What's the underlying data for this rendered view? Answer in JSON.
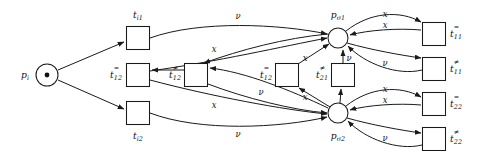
{
  "figure": {
    "kind": "petri-net-diagram",
    "background_color": "#ffffff",
    "stroke_color": "#1a1a1a"
  },
  "places": [
    {
      "id": "p_i",
      "label": "p",
      "sub": "i",
      "tokens": 1,
      "label_position": "left",
      "x": 47,
      "y": 75,
      "r": 11
    },
    {
      "id": "p_sigma1",
      "label": "p",
      "sub": "σ1",
      "tokens": 0,
      "label_position": "above",
      "x": 338,
      "y": 38,
      "r": 10
    },
    {
      "id": "p_sigma2",
      "label": "p",
      "sub": "σ2",
      "tokens": 0,
      "label_position": "below",
      "x": 338,
      "y": 113,
      "r": 10
    }
  ],
  "transitions": [
    {
      "id": "t_i1",
      "label": "t",
      "sub": "i1",
      "sup": "",
      "label_position": "above",
      "x": 138,
      "y": 38,
      "w": 23,
      "h": 23
    },
    {
      "id": "t_i2",
      "label": "t",
      "sub": "i2",
      "sup": "",
      "label_position": "below",
      "x": 138,
      "y": 113,
      "w": 23,
      "h": 23
    },
    {
      "id": "t_12_eq",
      "label": "t",
      "sub": "12",
      "sup": "=",
      "label_position": "left",
      "x": 138,
      "y": 75,
      "w": 23,
      "h": 23
    },
    {
      "id": "t_12_neq",
      "label": "t",
      "sub": "12",
      "sup": "≠",
      "label_position": "left",
      "x": 196,
      "y": 75,
      "w": 23,
      "h": 23
    },
    {
      "id": "t_12_eq_b",
      "label": "t",
      "sub": "12",
      "sup": "=",
      "label_position": "left",
      "x": 287,
      "y": 75,
      "w": 23,
      "h": 23
    },
    {
      "id": "t_21_neq",
      "label": "t",
      "sub": "21",
      "sup": "≠",
      "label_position": "left",
      "x": 343,
      "y": 75,
      "w": 23,
      "h": 23
    },
    {
      "id": "t_11_eq",
      "label": "t",
      "sub": "11",
      "sup": "=",
      "label_position": "right",
      "x": 434,
      "y": 34,
      "w": 23,
      "h": 23
    },
    {
      "id": "t_11_neq",
      "label": "t",
      "sub": "11",
      "sup": "≠",
      "label_position": "right",
      "x": 434,
      "y": 69,
      "w": 23,
      "h": 23
    },
    {
      "id": "t_22_eq",
      "label": "t",
      "sub": "22",
      "sup": "=",
      "label_position": "right",
      "x": 434,
      "y": 104,
      "w": 23,
      "h": 23
    },
    {
      "id": "t_22_neq",
      "label": "t",
      "sub": "22",
      "sup": "≠",
      "label_position": "right",
      "x": 434,
      "y": 139,
      "w": 23,
      "h": 23
    }
  ],
  "arc_labels": [
    {
      "id": "arc-lbl-nu-top",
      "text": "ν",
      "x": 238,
      "y": 16
    },
    {
      "id": "arc-lbl-x-upper-mid",
      "text": "x",
      "x": 214,
      "y": 49
    },
    {
      "id": "arc-lbl-x-to-sigma1",
      "text": "x",
      "x": 305,
      "y": 58
    },
    {
      "id": "arc-lbl-nu-t21-up",
      "text": "ν",
      "x": 349,
      "y": 58
    },
    {
      "id": "arc-lbl-x-t11-top",
      "text": "x",
      "x": 385,
      "y": 14
    },
    {
      "id": "arc-lbl-x-t11-second",
      "text": "x",
      "x": 385,
      "y": 25
    },
    {
      "id": "arc-lbl-nu-t11-bottom",
      "text": "ν",
      "x": 385,
      "y": 63
    },
    {
      "id": "arc-lbl-x-lower-mid",
      "text": "x",
      "x": 214,
      "y": 105
    },
    {
      "id": "arc-lbl-nu-bottom",
      "text": "ν",
      "x": 238,
      "y": 134
    },
    {
      "id": "arc-lbl-nu-mid-low",
      "text": "ν",
      "x": 261,
      "y": 92
    },
    {
      "id": "arc-lbl-x-to-sigma2",
      "text": "x",
      "x": 305,
      "y": 97
    },
    {
      "id": "arc-lbl-x-t22-top",
      "text": "x",
      "x": 385,
      "y": 89
    },
    {
      "id": "arc-lbl-x-t22-second",
      "text": "x",
      "x": 385,
      "y": 100
    },
    {
      "id": "arc-lbl-nu-t22-bottom",
      "text": "ν",
      "x": 385,
      "y": 138
    }
  ]
}
